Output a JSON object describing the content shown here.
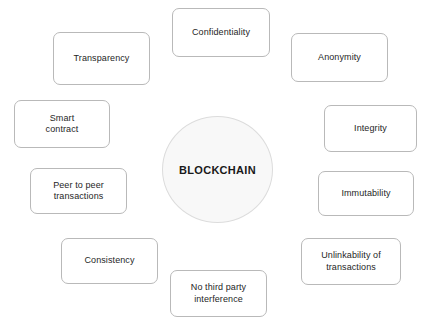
{
  "diagram": {
    "type": "hub-and-spoke",
    "canvas": {
      "width": 427,
      "height": 324,
      "background": "#ffffff"
    },
    "hub": {
      "label": "BLOCKCHAIN",
      "shape": "circle",
      "fill": "#f8f8f8",
      "border_color": "#dcdcdc",
      "text_color": "#1a1a1a",
      "x": 162,
      "y": 116,
      "width": 111,
      "height": 107
    },
    "node_style": {
      "fill": "#ffffff",
      "border_color": "#b9b9b9",
      "text_color": "#262626",
      "corner_radius": 7
    },
    "nodes": [
      {
        "id": "confidentiality",
        "label": "Confidentiality",
        "x": 172,
        "y": 8,
        "width": 98,
        "height": 49
      },
      {
        "id": "transparency",
        "label": "Transparency",
        "x": 53,
        "y": 32,
        "width": 97,
        "height": 53
      },
      {
        "id": "anonymity",
        "label": "Anonymity",
        "x": 291,
        "y": 33,
        "width": 97,
        "height": 49
      },
      {
        "id": "smart-contract",
        "label": "Smart\ncontract",
        "x": 14,
        "y": 100,
        "width": 96,
        "height": 48
      },
      {
        "id": "integrity",
        "label": "Integrity",
        "x": 324,
        "y": 105,
        "width": 93,
        "height": 47
      },
      {
        "id": "peer-to-peer-transactions",
        "label": "Peer to peer\ntransactions",
        "x": 30,
        "y": 168,
        "width": 97,
        "height": 46
      },
      {
        "id": "immutability",
        "label": "Immutability",
        "x": 318,
        "y": 171,
        "width": 96,
        "height": 45
      },
      {
        "id": "consistency",
        "label": "Consistency",
        "x": 61,
        "y": 238,
        "width": 97,
        "height": 46
      },
      {
        "id": "unlinkability-of-transactions",
        "label": "Unlinkability of\ntransactions",
        "x": 301,
        "y": 238,
        "width": 100,
        "height": 47
      },
      {
        "id": "no-third-party-interference",
        "label": "No third party\ninterference",
        "x": 170,
        "y": 270,
        "width": 97,
        "height": 47
      }
    ]
  }
}
